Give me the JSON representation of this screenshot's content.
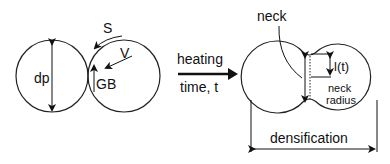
{
  "diagram": {
    "left": {
      "diameter_label": "dp",
      "surface_label": "S",
      "volume_label": "V",
      "grain_boundary_label": "GB"
    },
    "process": {
      "top_label": "heating",
      "bottom_label": "time, t"
    },
    "right": {
      "neck_label": "neck",
      "length_label": "l(t)",
      "neck_radius_label_1": "neck",
      "neck_radius_label_2": "radius",
      "densification_label": "densification"
    }
  }
}
